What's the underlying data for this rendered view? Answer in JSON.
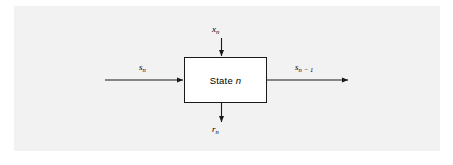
{
  "figure": {
    "kind": "block-diagram",
    "background_color": "#f2f2f2",
    "page_color": "#ffffff",
    "line_color": "#1a1a1a"
  },
  "block": {
    "label_text": "State",
    "label_variable": "n",
    "fill_color": "#ffffff",
    "border_color": "#1a1a1a"
  },
  "signals": {
    "input_state": {
      "symbol": "s",
      "subscript": "n",
      "direction": "left-to-right",
      "role": "input"
    },
    "input_drive": {
      "symbol": "x",
      "subscript": "n",
      "direction": "top-to-bottom",
      "role": "input"
    },
    "output_state": {
      "symbol": "s",
      "subscript": "n − 1",
      "direction": "left-to-right",
      "role": "output"
    },
    "output_result": {
      "symbol": "r",
      "subscript": "n",
      "direction": "top-to-bottom",
      "role": "output"
    }
  }
}
